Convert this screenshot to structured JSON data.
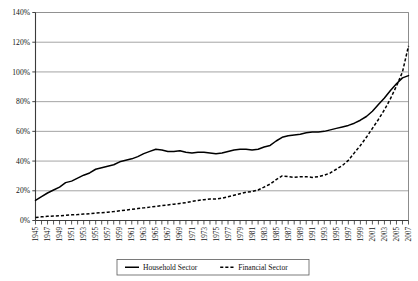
{
  "chart_data": {
    "type": "line",
    "title": "",
    "subtitle": "",
    "xlabel": "",
    "ylabel": "",
    "ylim": [
      0,
      140
    ],
    "xlim": [
      1945,
      2007
    ],
    "grid": true,
    "grid_axis": "y",
    "legend_position": "bottom-center",
    "y_ticks": [
      "0%",
      "20%",
      "40%",
      "60%",
      "80%",
      "100%",
      "120%",
      "140%"
    ],
    "y_tick_values": [
      0,
      20,
      40,
      60,
      80,
      100,
      120,
      140
    ],
    "x_tick_labels": [
      "1945",
      "1947",
      "1949",
      "1951",
      "1953",
      "1955",
      "1957",
      "1959",
      "1961",
      "1963",
      "1965",
      "1967",
      "1969",
      "1971",
      "1973",
      "1975",
      "1977",
      "1979",
      "1981",
      "1983",
      "1985",
      "1987",
      "1989",
      "1991",
      "1993",
      "1995",
      "1997",
      "1999",
      "2001",
      "2003",
      "2005",
      "2007"
    ],
    "x": [
      1945,
      1946,
      1947,
      1948,
      1949,
      1950,
      1951,
      1952,
      1953,
      1954,
      1955,
      1956,
      1957,
      1958,
      1959,
      1960,
      1961,
      1962,
      1963,
      1964,
      1965,
      1966,
      1967,
      1968,
      1969,
      1970,
      1971,
      1972,
      1973,
      1974,
      1975,
      1976,
      1977,
      1978,
      1979,
      1980,
      1981,
      1982,
      1983,
      1984,
      1985,
      1986,
      1987,
      1988,
      1989,
      1990,
      1991,
      1992,
      1993,
      1994,
      1995,
      1996,
      1997,
      1998,
      1999,
      2000,
      2001,
      2002,
      2003,
      2004,
      2005,
      2006,
      2007
    ],
    "series": [
      {
        "name": "Household Sector",
        "style": "solid",
        "color": "#000000",
        "values": [
          13.5,
          16.0,
          18.5,
          20.5,
          22.5,
          25.5,
          26.5,
          28.5,
          30.5,
          32.0,
          34.5,
          35.5,
          36.5,
          37.5,
          39.5,
          40.5,
          41.5,
          43.0,
          45.0,
          46.5,
          48.0,
          47.5,
          46.5,
          46.5,
          47.0,
          46.0,
          45.5,
          46.0,
          46.0,
          45.5,
          45.0,
          45.5,
          46.5,
          47.5,
          48.0,
          48.0,
          47.5,
          48.0,
          49.5,
          50.5,
          53.5,
          56.0,
          57.0,
          57.5,
          58.0,
          59.0,
          59.5,
          59.5,
          60.0,
          61.0,
          62.0,
          63.0,
          64.0,
          65.5,
          67.5,
          70.0,
          73.5,
          78.0,
          82.5,
          87.5,
          92.0,
          96.0,
          97.5
        ]
      },
      {
        "name": "Financial Sector",
        "style": "dashed",
        "color": "#000000",
        "values": [
          2.0,
          2.5,
          2.8,
          3.0,
          3.2,
          3.5,
          3.8,
          4.0,
          4.3,
          4.6,
          5.0,
          5.3,
          5.6,
          6.0,
          6.5,
          7.0,
          7.5,
          8.0,
          8.5,
          9.0,
          9.5,
          10.0,
          10.5,
          11.0,
          11.5,
          12.0,
          12.8,
          13.5,
          14.0,
          14.5,
          14.5,
          15.0,
          16.0,
          17.0,
          18.0,
          19.0,
          19.5,
          20.5,
          22.5,
          24.5,
          27.5,
          30.0,
          29.5,
          29.0,
          29.5,
          29.5,
          29.0,
          29.5,
          30.5,
          32.0,
          34.5,
          37.0,
          40.5,
          45.5,
          50.5,
          56.0,
          62.0,
          68.0,
          74.5,
          82.0,
          90.5,
          100.0,
          117.5
        ]
      }
    ]
  },
  "legend": {
    "entries": [
      {
        "label": "Household Sector",
        "style": "solid"
      },
      {
        "label": "Financial Sector",
        "style": "dashed"
      }
    ]
  }
}
